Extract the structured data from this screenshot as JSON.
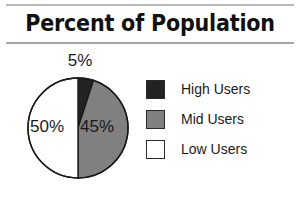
{
  "figure": {
    "title": "Percent of Population",
    "background": "#ffffff",
    "rule_color": "#b9b9b9"
  },
  "legend": {
    "position": "right",
    "items": [
      {
        "label": "High Users",
        "color": "#222222",
        "swatch": "high-users-swatch"
      },
      {
        "label": "Mid Users",
        "color": "#808080",
        "swatch": "mid-users-swatch"
      },
      {
        "label": "Low Users",
        "color": "#ffffff",
        "swatch": "low-users-swatch"
      }
    ]
  },
  "slice_labels": {
    "high": "5%",
    "mid": "45%",
    "low": "50%"
  },
  "chart_data": {
    "type": "pie",
    "title": "Percent of Population",
    "subtitle": "",
    "xlabel": "",
    "ylabel": "",
    "categories": [
      "High Users",
      "Mid Users",
      "Low Users"
    ],
    "values": [
      5,
      45,
      50
    ],
    "value_unit": "percent",
    "data_labels": [
      "5%",
      "45%",
      "50%"
    ],
    "colors": [
      "#222222",
      "#808080",
      "#ffffff"
    ],
    "slice_border_color": "#1a1a1a",
    "start_angle_deg": 0,
    "direction": "clockwise",
    "legend": {
      "show": true,
      "position": "right",
      "entries": [
        "High Users",
        "Mid Users",
        "Low Users"
      ]
    },
    "grid": false,
    "total": 100
  }
}
